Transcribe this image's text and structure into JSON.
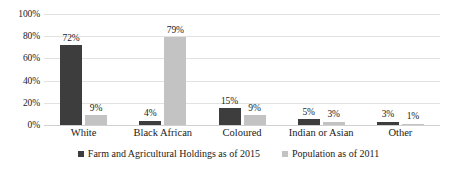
{
  "chart_data": {
    "type": "bar",
    "title": "",
    "subtitle": "",
    "xlabel": "",
    "ylabel": "",
    "categories": [
      "White",
      "Black African",
      "Coloured",
      "Indian or Asian",
      "Other"
    ],
    "series": [
      {
        "name": "Farm and Agricultural Holdings as of 2015",
        "color": "#3d3d3d",
        "values": [
          72,
          4,
          15,
          5,
          3
        ],
        "labels": [
          "72%",
          "4%",
          "15%",
          "5%",
          "3%"
        ]
      },
      {
        "name": "Population as of 2011",
        "color": "#c3c3c3",
        "values": [
          9,
          79,
          9,
          3,
          1
        ],
        "labels": [
          "9%",
          "79%",
          "9%",
          "3%",
          "1%"
        ]
      }
    ],
    "ylim": [
      0,
      100
    ],
    "yticks": [
      100,
      80,
      60,
      40,
      20,
      0
    ],
    "ytick_labels": [
      "100%",
      "80%",
      "60%",
      "40%",
      "20%",
      "0%"
    ],
    "grid": true,
    "legend_position": "bottom",
    "annotations": []
  }
}
